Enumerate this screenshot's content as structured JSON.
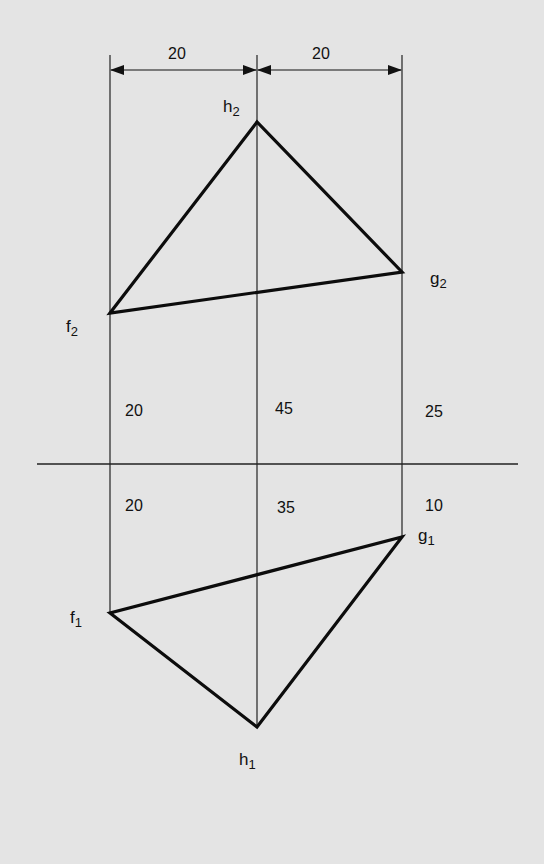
{
  "diagram": {
    "type": "orthographic-projection",
    "ground_line": {
      "x1": 37,
      "x2": 518,
      "y": 464
    },
    "projectors": {
      "f": {
        "x": 110,
        "y_top": 5,
        "y_bottom": 613
      },
      "h": {
        "x": 257,
        "y_top": 5,
        "y_bottom": 727
      },
      "g": {
        "x": 402,
        "y_top": 5,
        "y_bottom": 537
      }
    },
    "elevation_triangle": {
      "f2": {
        "x": 110,
        "y": 313
      },
      "h2": {
        "x": 257,
        "y": 122
      },
      "g2": {
        "x": 402,
        "y": 272
      }
    },
    "plan_triangle": {
      "f1": {
        "x": 110,
        "y": 613
      },
      "h1": {
        "x": 257,
        "y": 727
      },
      "g1": {
        "x": 402,
        "y": 537
      }
    },
    "horizontal_dimensions": {
      "left": {
        "value": "20",
        "x1": 110,
        "x2": 257,
        "y": 15
      },
      "right": {
        "value": "20",
        "x1": 257,
        "x2": 402,
        "y": 15
      }
    },
    "point_labels": {
      "h2": {
        "letter": "h",
        "sub": "2"
      },
      "g2": {
        "letter": "g",
        "sub": "2"
      },
      "f2": {
        "letter": "f",
        "sub": "2"
      },
      "g1": {
        "letter": "g",
        "sub": "1"
      },
      "f1": {
        "letter": "f",
        "sub": "1"
      },
      "h1": {
        "letter": "h",
        "sub": "1"
      }
    },
    "heights_above_xy": {
      "f": "20",
      "h": "45",
      "g": "25"
    },
    "depths_below_xy": {
      "f": "20",
      "h": "35",
      "g": "10"
    }
  },
  "colors": {
    "background": "#e4e4e4",
    "ink": "#111111"
  }
}
